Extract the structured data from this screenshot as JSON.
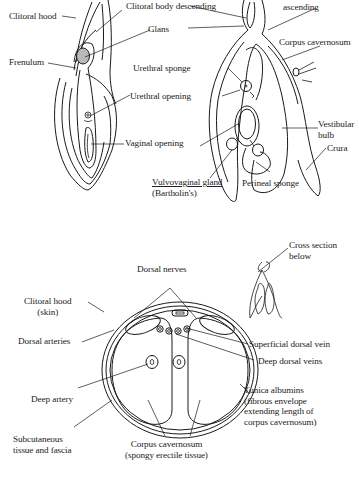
{
  "figures": {
    "external_view": {
      "labels": {
        "clitoral_hood": "Clitoral hood",
        "glans": "Glans",
        "frenulum": "Frenulum",
        "urethral_opening": "Urethral opening",
        "vaginal_opening": "Vaginal opening"
      }
    },
    "internal_structure": {
      "labels": {
        "clitoral_body_descending": "Clitoral body descending",
        "clitoral_body_ascending_line1": "Clitoral body",
        "clitoral_body_ascending_line2": "ascending",
        "corpus_cavernosum": "Corpus cavernosum",
        "urethral_sponge": "Urethral sponge",
        "vestibular_bulb_line1": "Vestibular",
        "vestibular_bulb_line2": "bulb",
        "crura": "Crura",
        "vulvovaginal_gland_line1": "Vulvovaginal gland",
        "vulvovaginal_gland_line2": "(Bartholin's)",
        "perineal_sponge": "Perineal sponge"
      }
    },
    "cross_section_locator": {
      "labels": {
        "line1": "Cross section",
        "line2": "below"
      }
    },
    "cross_section": {
      "labels": {
        "dorsal_nerves": "Dorsal nerves",
        "clitoral_hood_line1": "Clitoral hood",
        "clitoral_hood_line2": "(skin)",
        "dorsal_arteries": "Dorsal arteries",
        "superficial_dorsal_vein": "Superficial dorsal vein",
        "deep_dorsal_veins": "Deep dorsal veins",
        "deep_artery": "Deep artery",
        "tunica_line1": "Tunica albumins",
        "tunica_line2": "(fibrous envelope",
        "tunica_line3": "extending length of",
        "tunica_line4": "corpus cavernosum)",
        "subcutaneous_line1": "Subcutaneous",
        "subcutaneous_line2": "tissue and fascia",
        "corpus_cav_line1": "Corpus cavernosum",
        "corpus_cav_line2": "(spongy erectile tissue)"
      }
    }
  }
}
